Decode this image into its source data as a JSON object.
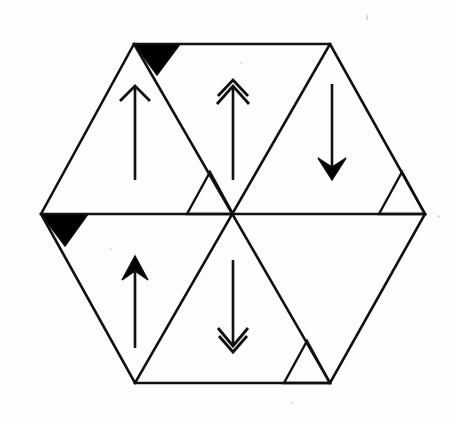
{
  "figure": {
    "background_color": "#fdfdfc",
    "stroke_color": "#101010",
    "fill_color": "#000000",
    "stroke_width": 2.6,
    "canvas": {
      "width": 456,
      "height": 424
    }
  },
  "hexagon": {
    "name": "outer-hexagon",
    "center": {
      "x": 233,
      "y": 214
    },
    "vertices": [
      {
        "label": "left",
        "x": 41,
        "y": 214
      },
      {
        "label": "top-left",
        "x": 134,
        "y": 44
      },
      {
        "label": "top-right",
        "x": 330,
        "y": 44
      },
      {
        "label": "right",
        "x": 425,
        "y": 214
      },
      {
        "label": "bottom-right",
        "x": 330,
        "y": 383
      },
      {
        "label": "bottom-left",
        "x": 135,
        "y": 383
      }
    ]
  },
  "diagonals": [
    {
      "name": "horizontal-diagonal",
      "x1": 41,
      "y1": 214,
      "x2": 425,
      "y2": 214
    },
    {
      "name": "diagonal-topleft-bottomright",
      "x1": 134,
      "y1": 44,
      "x2": 330,
      "y2": 383
    },
    {
      "name": "diagonal-topright-bottomleft",
      "x1": 330,
      "y1": 44,
      "x2": 135,
      "y2": 383
    }
  ],
  "sectors": [
    {
      "name": "sector-upper-left",
      "position": "upper-left",
      "arrow": "single-open-up-arrow",
      "arrow_direction": "up",
      "arrow_head_style": "open-barb",
      "arrow_head_count": 1
    },
    {
      "name": "sector-upper-center",
      "position": "upper-center",
      "arrow": "double-open-up-arrow",
      "arrow_direction": "up",
      "arrow_head_style": "open-barb",
      "arrow_head_count": 2
    },
    {
      "name": "sector-upper-right",
      "position": "upper-right",
      "arrow": "single-solid-down-arrow",
      "arrow_direction": "down",
      "arrow_head_style": "solid",
      "arrow_head_count": 1
    },
    {
      "name": "sector-lower-left",
      "position": "lower-left",
      "arrow": "single-solid-up-arrow",
      "arrow_direction": "up",
      "arrow_head_style": "solid",
      "arrow_head_count": 1
    },
    {
      "name": "sector-lower-center",
      "position": "lower-center",
      "arrow": "double-open-down-arrow",
      "arrow_direction": "down",
      "arrow_head_style": "open-barb",
      "arrow_head_count": 2
    },
    {
      "name": "sector-lower-right",
      "position": "lower-right",
      "arrow": "none",
      "arrow_direction": "none",
      "arrow_head_style": "none",
      "arrow_head_count": 0
    }
  ],
  "corner_triangles": [
    {
      "name": "black-triangle-top-left",
      "fill": "filled",
      "points": "134,44 180,44 157,75",
      "location": "top edge at top-left vertex"
    },
    {
      "name": "black-triangle-left-vertex",
      "fill": "filled",
      "points": "41,214 88,214 65,246",
      "location": "horizontal diagonal at left vertex"
    },
    {
      "name": "outline-triangle-right-vertex",
      "fill": "outline",
      "points": "379,214 425,214 402,172",
      "location": "horizontal diagonal near right vertex"
    },
    {
      "name": "outline-triangle-bottom-right",
      "fill": "outline",
      "points": "284,383 330,383 307,341",
      "location": "bottom edge near bottom-right vertex"
    },
    {
      "name": "outline-triangle-center-left",
      "fill": "outline",
      "points": "187,214 233,214 210,172",
      "location": "horizontal diagonal left of center"
    }
  ],
  "arrow_shafts": [
    {
      "name": "shaft-upper-left",
      "x": 135,
      "y_top": 88,
      "y_bottom": 180
    },
    {
      "name": "shaft-upper-center",
      "x": 233,
      "y_top": 88,
      "y_bottom": 180
    },
    {
      "name": "shaft-upper-right",
      "x": 332,
      "y_top": 84,
      "y_bottom": 176
    },
    {
      "name": "shaft-lower-left",
      "x": 135,
      "y_top": 256,
      "y_bottom": 348
    },
    {
      "name": "shaft-lower-center",
      "x": 233,
      "y_top": 260,
      "y_bottom": 344
    }
  ]
}
